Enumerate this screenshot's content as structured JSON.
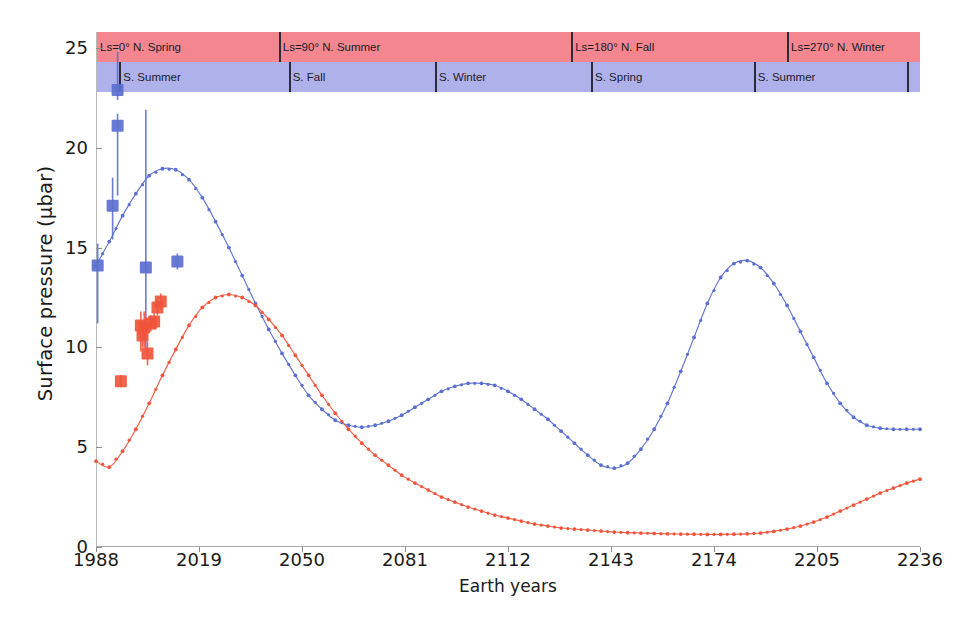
{
  "chart_data": {
    "type": "line",
    "title": "",
    "xlabel": "Earth years",
    "ylabel": "Surface pressure (μbar)",
    "xlim": [
      1988,
      2236
    ],
    "ylim": [
      0,
      25.8
    ],
    "xticks": [
      1988,
      2019,
      2050,
      2081,
      2112,
      2143,
      2174,
      2205,
      2236
    ],
    "yticks": [
      0,
      5,
      10,
      15,
      20,
      25
    ],
    "grid": false,
    "legend_position": "none",
    "colors": {
      "series_blue": "#5b6fcf",
      "series_red": "#f0553c",
      "band_north": "#f4868f",
      "band_south": "#afb1ea",
      "axis": "#b9b9b9"
    },
    "series": [
      {
        "name": "Model (blue)",
        "color": "#5b6fcf",
        "style": "dotted-line",
        "x": [
          1988,
          1992,
          1996,
          2000,
          2004,
          2008,
          2012,
          2016,
          2020,
          2024,
          2028,
          2032,
          2036,
          2040,
          2044,
          2048,
          2052,
          2056,
          2060,
          2064,
          2068,
          2072,
          2076,
          2080,
          2084,
          2088,
          2092,
          2096,
          2100,
          2104,
          2108,
          2112,
          2116,
          2120,
          2124,
          2128,
          2132,
          2136,
          2140,
          2144,
          2148,
          2152,
          2156,
          2160,
          2164,
          2168,
          2172,
          2176,
          2180,
          2184,
          2188,
          2192,
          2196,
          2200,
          2204,
          2208,
          2212,
          2216,
          2220,
          2224,
          2228,
          2232,
          2236
        ],
        "y": [
          14.1,
          15.3,
          16.6,
          17.7,
          18.6,
          18.95,
          18.9,
          18.4,
          17.5,
          16.3,
          15.0,
          13.6,
          12.2,
          10.9,
          9.7,
          8.6,
          7.6,
          6.9,
          6.35,
          6.1,
          6.0,
          6.1,
          6.3,
          6.6,
          7.0,
          7.4,
          7.8,
          8.05,
          8.2,
          8.2,
          8.1,
          7.8,
          7.4,
          6.9,
          6.4,
          5.8,
          5.2,
          4.6,
          4.1,
          3.95,
          4.2,
          4.9,
          5.9,
          7.2,
          8.8,
          10.5,
          12.2,
          13.5,
          14.2,
          14.35,
          14.0,
          13.2,
          12.1,
          10.8,
          9.5,
          8.2,
          7.2,
          6.5,
          6.1,
          5.95,
          5.9,
          5.9,
          5.9
        ]
      },
      {
        "name": "Model (red)",
        "color": "#f0553c",
        "style": "dotted-line",
        "x": [
          1988,
          1992,
          1996,
          2000,
          2004,
          2008,
          2012,
          2016,
          2020,
          2024,
          2028,
          2032,
          2036,
          2040,
          2044,
          2048,
          2052,
          2056,
          2060,
          2064,
          2068,
          2072,
          2076,
          2080,
          2084,
          2088,
          2092,
          2096,
          2100,
          2104,
          2108,
          2112,
          2116,
          2120,
          2124,
          2128,
          2132,
          2136,
          2140,
          2144,
          2148,
          2152,
          2156,
          2160,
          2164,
          2168,
          2172,
          2176,
          2180,
          2184,
          2188,
          2192,
          2196,
          2200,
          2204,
          2208,
          2212,
          2216,
          2220,
          2224,
          2228,
          2232,
          2236
        ],
        "y": [
          4.3,
          4.0,
          4.8,
          5.9,
          7.2,
          8.6,
          9.9,
          11.1,
          12.0,
          12.5,
          12.65,
          12.5,
          12.1,
          11.4,
          10.6,
          9.6,
          8.6,
          7.6,
          6.7,
          5.9,
          5.2,
          4.6,
          4.1,
          3.6,
          3.2,
          2.85,
          2.5,
          2.25,
          2.0,
          1.8,
          1.6,
          1.45,
          1.3,
          1.15,
          1.05,
          0.95,
          0.9,
          0.85,
          0.8,
          0.75,
          0.72,
          0.7,
          0.68,
          0.66,
          0.65,
          0.64,
          0.63,
          0.63,
          0.64,
          0.66,
          0.7,
          0.78,
          0.9,
          1.05,
          1.25,
          1.5,
          1.8,
          2.1,
          2.4,
          2.7,
          2.95,
          3.2,
          3.4
        ]
      }
    ],
    "observations_blue": {
      "name": "Observations (blue)",
      "color": "#5b6fcf",
      "marker": "square",
      "points": [
        {
          "x": 1988.5,
          "y": 14.1,
          "yerr_low": 2.9,
          "yerr_high": 1.1
        },
        {
          "x": 1993.0,
          "y": 17.1,
          "yerr_low": 1.7,
          "yerr_high": 1.4
        },
        {
          "x": 1994.5,
          "y": 22.9,
          "yerr_low": 0.5,
          "yerr_high": 1.9
        },
        {
          "x": 1994.5,
          "y": 21.1,
          "yerr_low": 3.5,
          "yerr_high": 0.6
        },
        {
          "x": 2003.0,
          "y": 14.0,
          "yerr_low": 4.1,
          "yerr_high": 7.9
        },
        {
          "x": 2012.5,
          "y": 14.3,
          "yerr_low": 0.4,
          "yerr_high": 0.4
        }
      ]
    },
    "observations_red": {
      "name": "Observations (red)",
      "color": "#f0553c",
      "marker": "square",
      "points": [
        {
          "x": 1995.5,
          "y": 8.3,
          "yerr_low": 0.3,
          "yerr_high": 0.3
        },
        {
          "x": 2001.5,
          "y": 11.1,
          "yerr_low": 1.3,
          "yerr_high": 0.7
        },
        {
          "x": 2002.0,
          "y": 10.6,
          "yerr_low": 0.6,
          "yerr_high": 0.6
        },
        {
          "x": 2002.5,
          "y": 11.0,
          "yerr_low": 1.0,
          "yerr_high": 0.8
        },
        {
          "x": 2003.5,
          "y": 9.7,
          "yerr_low": 0.6,
          "yerr_high": 0.6
        },
        {
          "x": 2004.5,
          "y": 11.2,
          "yerr_low": 0.4,
          "yerr_high": 0.4
        },
        {
          "x": 2005.5,
          "y": 11.3,
          "yerr_low": 0.4,
          "yerr_high": 0.4
        },
        {
          "x": 2006.5,
          "y": 12.0,
          "yerr_low": 0.4,
          "yerr_high": 0.4
        },
        {
          "x": 2007.5,
          "y": 12.3,
          "yerr_low": 0.4,
          "yerr_high": 0.4
        }
      ]
    },
    "season_bands": {
      "north": {
        "color": "#f4868f",
        "segments": [
          {
            "label": "Ls=0° N. Spring",
            "start": 1988,
            "end": 2043
          },
          {
            "label": "Ls=90° N. Summer",
            "start": 2043,
            "end": 2131
          },
          {
            "label": "Ls=180° N. Fall",
            "start": 2131,
            "end": 2196
          },
          {
            "label": "Ls=270° N. Winter",
            "start": 2196,
            "end": 2236
          }
        ]
      },
      "south": {
        "color": "#afb1ea",
        "segments": [
          {
            "label": "S. Summer",
            "start": 1995,
            "end": 2046
          },
          {
            "label": "S. Fall",
            "start": 2046,
            "end": 2090
          },
          {
            "label": "S. Winter",
            "start": 2090,
            "end": 2137
          },
          {
            "label": "S. Spring",
            "start": 2137,
            "end": 2186
          },
          {
            "label": "S. Summer",
            "start": 2186,
            "end": 2232
          }
        ]
      }
    }
  },
  "axis": {
    "ylabel": "Surface pressure (μbar)",
    "xlabel": "Earth years",
    "ytick_labels": [
      "0",
      "5",
      "10",
      "15",
      "20",
      "25"
    ],
    "xtick_labels": [
      "1988",
      "2019",
      "2050",
      "2081",
      "2112",
      "2143",
      "2174",
      "2205",
      "2236"
    ]
  },
  "bands": {
    "north_labels": [
      "Ls=0° N. Spring",
      "Ls=90° N. Summer",
      "Ls=180° N. Fall",
      "Ls=270° N. Winter"
    ],
    "south_labels": [
      "S. Summer",
      "S. Fall",
      "S. Winter",
      "S. Spring",
      "S. Summer"
    ]
  }
}
